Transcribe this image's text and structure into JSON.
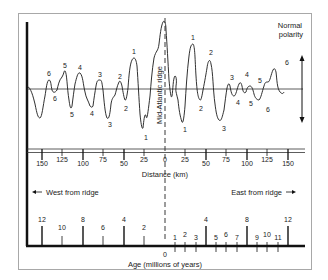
{
  "figure": {
    "polarity_label_line1": "Normal",
    "polarity_label_line2": "polarity",
    "ridge_label": "Mid-Atlantic ridge",
    "distance_axis": {
      "title": "Distance (km)",
      "ticks_west": [
        "150",
        "125",
        "100",
        "75",
        "50",
        "25"
      ],
      "tick_center": "0",
      "ticks_east": [
        "25",
        "50",
        "75",
        "100",
        "125",
        "150"
      ]
    },
    "direction_labels": {
      "west": "West from ridge",
      "east": "East from ridge"
    },
    "age_axis": {
      "title": "Age (millions of years)",
      "ticks_west": [
        "12",
        "10",
        "8",
        "6",
        "4",
        "2"
      ],
      "tick_center": "0",
      "ticks_east": [
        "1",
        "2",
        "3",
        "4",
        "5",
        "6",
        "7",
        "8",
        "9",
        "10",
        "11",
        "12"
      ]
    },
    "anomaly_labels": {
      "west_peaks": [
        "6",
        "5",
        "4",
        "3",
        "2",
        "1"
      ],
      "west_troughs": [
        "6",
        "5",
        "4",
        "3",
        "2",
        "1"
      ],
      "east_peaks": [
        "1",
        "2",
        "3",
        "4",
        "5",
        "6"
      ],
      "east_troughs": [
        "1",
        "2",
        "3",
        "4",
        "5",
        "6"
      ]
    },
    "colors": {
      "line": "#1a1a1a",
      "frame": "#a8a8a8",
      "background": "#ffffff"
    }
  }
}
